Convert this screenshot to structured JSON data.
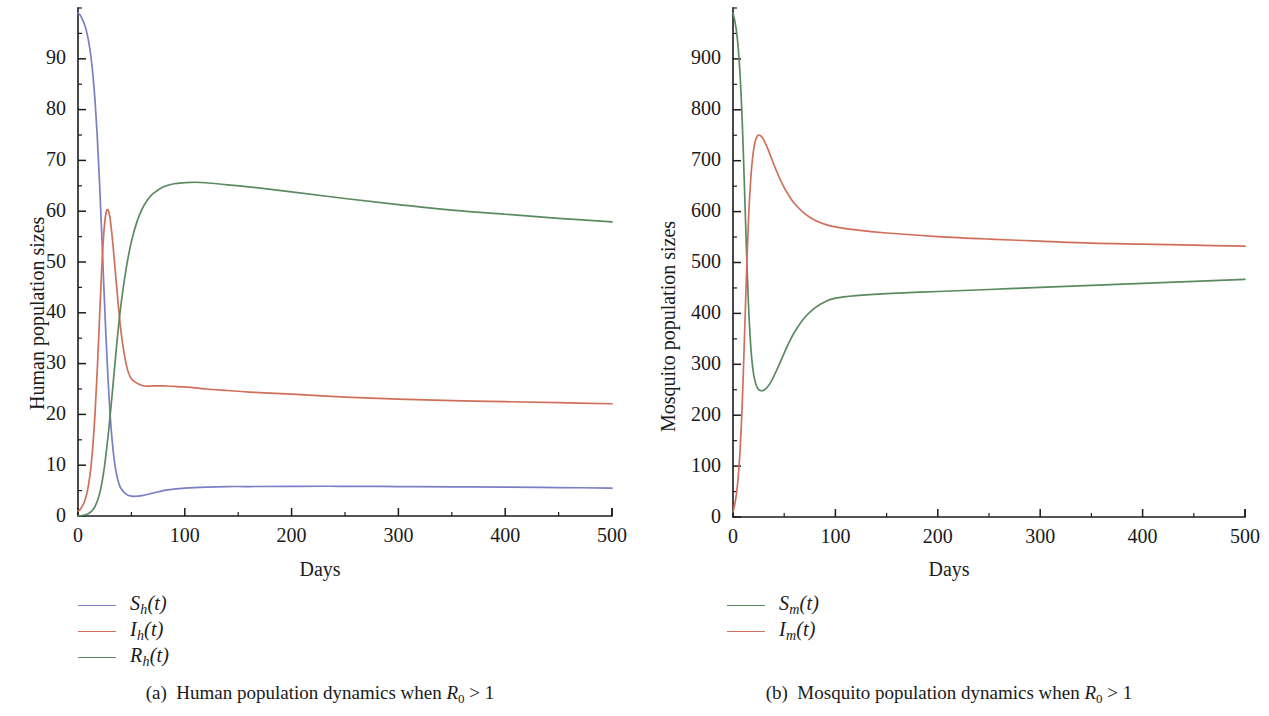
{
  "figure": {
    "panels": [
      {
        "id": "a",
        "caption_prefix": "(a)",
        "caption_text": "Human population dynamics when",
        "caption_symbol": "R",
        "caption_subscript": "0",
        "caption_relation": "> 1",
        "xlabel": "Days",
        "ylabel": "Human population sizes"
      },
      {
        "id": "b",
        "caption_prefix": "(b)",
        "caption_text": "Mosquito population dynamics when",
        "caption_symbol": "R",
        "caption_subscript": "0",
        "caption_relation": "> 1",
        "xlabel": "Days",
        "ylabel": "Mosquito population sizes"
      }
    ]
  },
  "colors": {
    "susceptible_human": "#7b7fc4",
    "infected": "#d0705c",
    "recovered_susceptible_mosquito": "#5a8a60",
    "axis": "#1c1c1c",
    "text": "#1a1a1a",
    "background": "#ffffff"
  },
  "chart_data": [
    {
      "type": "line",
      "panel": "a",
      "title": "(a) Human population dynamics when R_0 > 1",
      "xlabel": "Days",
      "ylabel": "Human population sizes",
      "xlim": [
        0,
        500
      ],
      "ylim": [
        0,
        100
      ],
      "xticks": [
        0,
        100,
        200,
        300,
        400,
        500
      ],
      "yticks": [
        0,
        10,
        20,
        30,
        40,
        50,
        60,
        70,
        80,
        90
      ],
      "xminor_step": 50,
      "yminor_step": 5,
      "grid": false,
      "legend_position": "below-left",
      "series": [
        {
          "name": "S_h(t)",
          "label_base": "S",
          "label_sub": "h",
          "label_tail": "(t)",
          "color": "#7b7fc4",
          "x": [
            0,
            2,
            4,
            6,
            8,
            10,
            12,
            14,
            16,
            18,
            20,
            22,
            24,
            26,
            28,
            30,
            32,
            34,
            36,
            38,
            40,
            45,
            50,
            60,
            70,
            80,
            90,
            100,
            120,
            140,
            160,
            200,
            250,
            300,
            350,
            400,
            450,
            500
          ],
          "y": [
            99,
            98.6,
            97.8,
            96.8,
            95.4,
            93.4,
            90.6,
            86.8,
            81.6,
            74.8,
            66.4,
            56.6,
            46.2,
            36.2,
            27.4,
            20.2,
            14.8,
            10.9,
            8.3,
            6.6,
            5.5,
            4.3,
            3.9,
            4.0,
            4.5,
            5.0,
            5.3,
            5.5,
            5.7,
            5.8,
            5.8,
            5.85,
            5.85,
            5.8,
            5.75,
            5.7,
            5.6,
            5.5
          ]
        },
        {
          "name": "I_h(t)",
          "label_base": "I",
          "label_sub": "h",
          "label_tail": "(t)",
          "color": "#d0705c",
          "x": [
            0,
            2,
            4,
            6,
            8,
            10,
            12,
            14,
            16,
            18,
            20,
            22,
            24,
            26,
            28,
            30,
            32,
            34,
            36,
            40,
            45,
            50,
            60,
            70,
            80,
            90,
            100,
            120,
            140,
            160,
            200,
            250,
            300,
            350,
            400,
            450,
            500
          ],
          "y": [
            1,
            1.3,
            1.9,
            2.8,
            4.2,
            6.3,
            9.4,
            14.0,
            20.4,
            28.6,
            38.2,
            47.6,
            55.2,
            59.4,
            60.3,
            58.6,
            55.0,
            50.4,
            45.6,
            36.8,
            30.0,
            27.0,
            25.7,
            25.6,
            25.6,
            25.5,
            25.4,
            25.0,
            24.7,
            24.4,
            24.0,
            23.4,
            23.0,
            22.7,
            22.5,
            22.3,
            22.1
          ]
        },
        {
          "name": "R_h(t)",
          "label_base": "R",
          "label_sub": "h",
          "label_tail": "(t)",
          "color": "#5a8a60",
          "x": [
            0,
            4,
            8,
            12,
            16,
            20,
            24,
            28,
            32,
            36,
            40,
            45,
            50,
            55,
            60,
            65,
            70,
            80,
            90,
            100,
            110,
            120,
            140,
            160,
            200,
            250,
            300,
            350,
            400,
            450,
            500
          ],
          "y": [
            0,
            0.1,
            0.3,
            0.8,
            1.9,
            4.2,
            8.6,
            15.4,
            24.0,
            33.2,
            41.2,
            48.6,
            54.0,
            57.8,
            60.4,
            62.2,
            63.4,
            64.8,
            65.4,
            65.6,
            65.7,
            65.6,
            65.2,
            64.8,
            63.8,
            62.5,
            61.3,
            60.2,
            59.4,
            58.6,
            57.9
          ]
        }
      ]
    },
    {
      "type": "line",
      "panel": "b",
      "title": "(b) Mosquito population dynamics when R_0 > 1",
      "xlabel": "Days",
      "ylabel": "Mosquito population sizes",
      "xlim": [
        0,
        500
      ],
      "ylim": [
        0,
        1000
      ],
      "xticks": [
        0,
        100,
        200,
        300,
        400,
        500
      ],
      "yticks": [
        0,
        100,
        200,
        300,
        400,
        500,
        600,
        700,
        800,
        900
      ],
      "xminor_step": 50,
      "yminor_step": 50,
      "grid": false,
      "legend_position": "below-center",
      "series": [
        {
          "name": "S_m(t)",
          "label_base": "S",
          "label_sub": "m",
          "label_tail": "(t)",
          "color": "#5a8a60",
          "x": [
            0,
            1,
            2,
            3,
            4,
            5,
            6,
            7,
            8,
            9,
            10,
            11,
            12,
            13,
            14,
            15,
            16,
            18,
            20,
            22,
            24,
            26,
            28,
            30,
            33,
            36,
            40,
            45,
            50,
            55,
            60,
            70,
            80,
            90,
            100,
            120,
            150,
            200,
            250,
            300,
            350,
            400,
            450,
            500
          ],
          "y": [
            990,
            982,
            972,
            960,
            944,
            924,
            898,
            866,
            826,
            778,
            722,
            660,
            596,
            534,
            476,
            424,
            380,
            318,
            282,
            263,
            253,
            249,
            248,
            249,
            254,
            262,
            277,
            299,
            322,
            344,
            363,
            392,
            411,
            423,
            430,
            435,
            439,
            443,
            447,
            451,
            455,
            459,
            463,
            467
          ]
        },
        {
          "name": "I_m(t)",
          "label_base": "I",
          "label_sub": "m",
          "label_tail": "(t)",
          "color": "#d0705c",
          "x": [
            0,
            1,
            2,
            3,
            4,
            5,
            6,
            7,
            8,
            9,
            10,
            11,
            12,
            13,
            14,
            15,
            16,
            18,
            20,
            22,
            24,
            26,
            28,
            30,
            33,
            36,
            40,
            45,
            50,
            55,
            60,
            70,
            80,
            90,
            100,
            120,
            150,
            200,
            250,
            300,
            350,
            400,
            450,
            500
          ],
          "y": [
            10,
            18,
            28,
            40,
            56,
            76,
            102,
            134,
            174,
            222,
            278,
            340,
            404,
            466,
            524,
            576,
            620,
            682,
            720,
            740,
            749,
            750,
            747,
            741,
            728,
            713,
            692,
            668,
            647,
            630,
            616,
            596,
            583,
            575,
            570,
            564,
            558,
            551,
            546,
            542,
            538,
            536,
            534,
            532
          ]
        }
      ]
    }
  ]
}
